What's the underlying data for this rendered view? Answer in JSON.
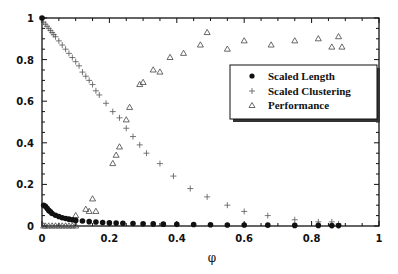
{
  "chart_data": {
    "type": "scatter",
    "title": "",
    "xlabel": "φ",
    "ylabel": "",
    "xlim": [
      0,
      1
    ],
    "ylim": [
      0,
      1
    ],
    "grid": false,
    "legend_position": "upper right (inside)",
    "x_ticks": [
      "0",
      "0.2",
      "0.4",
      "0.6",
      "0.8",
      "1"
    ],
    "y_ticks": [
      "0",
      "0.2",
      "0.4",
      "0.6",
      "0.8",
      "1"
    ],
    "series": [
      {
        "name": "Scaled Length",
        "marker": "filled-circle",
        "points": [
          [
            0.0,
            1.0
          ],
          [
            0.005,
            0.1
          ],
          [
            0.01,
            0.095
          ],
          [
            0.015,
            0.085
          ],
          [
            0.02,
            0.075
          ],
          [
            0.025,
            0.068
          ],
          [
            0.03,
            0.06
          ],
          [
            0.04,
            0.052
          ],
          [
            0.05,
            0.046
          ],
          [
            0.06,
            0.04
          ],
          [
            0.07,
            0.036
          ],
          [
            0.08,
            0.033
          ],
          [
            0.09,
            0.03
          ],
          [
            0.1,
            0.027
          ],
          [
            0.12,
            0.024
          ],
          [
            0.14,
            0.021
          ],
          [
            0.16,
            0.019
          ],
          [
            0.18,
            0.017
          ],
          [
            0.2,
            0.015
          ],
          [
            0.22,
            0.014
          ],
          [
            0.24,
            0.013
          ],
          [
            0.27,
            0.012
          ],
          [
            0.3,
            0.011
          ],
          [
            0.33,
            0.01
          ],
          [
            0.36,
            0.009
          ],
          [
            0.4,
            0.008
          ],
          [
            0.45,
            0.007
          ],
          [
            0.5,
            0.006
          ],
          [
            0.55,
            0.005
          ],
          [
            0.6,
            0.005
          ],
          [
            0.67,
            0.004
          ],
          [
            0.75,
            0.003
          ],
          [
            0.82,
            0.003
          ],
          [
            0.86,
            0.002
          ],
          [
            0.88,
            0.002
          ]
        ]
      },
      {
        "name": "Scaled Clustering",
        "marker": "plus",
        "points": [
          [
            0.005,
            0.98
          ],
          [
            0.01,
            0.97
          ],
          [
            0.015,
            0.96
          ],
          [
            0.02,
            0.95
          ],
          [
            0.025,
            0.94
          ],
          [
            0.03,
            0.93
          ],
          [
            0.035,
            0.92
          ],
          [
            0.04,
            0.91
          ],
          [
            0.05,
            0.89
          ],
          [
            0.06,
            0.87
          ],
          [
            0.07,
            0.85
          ],
          [
            0.08,
            0.83
          ],
          [
            0.09,
            0.81
          ],
          [
            0.1,
            0.79
          ],
          [
            0.11,
            0.77
          ],
          [
            0.12,
            0.74
          ],
          [
            0.13,
            0.72
          ],
          [
            0.14,
            0.7
          ],
          [
            0.15,
            0.68
          ],
          [
            0.16,
            0.65
          ],
          [
            0.17,
            0.63
          ],
          [
            0.19,
            0.59
          ],
          [
            0.21,
            0.55
          ],
          [
            0.23,
            0.52
          ],
          [
            0.25,
            0.47
          ],
          [
            0.27,
            0.43
          ],
          [
            0.29,
            0.39
          ],
          [
            0.31,
            0.35
          ],
          [
            0.35,
            0.3
          ],
          [
            0.39,
            0.24
          ],
          [
            0.44,
            0.18
          ],
          [
            0.49,
            0.14
          ],
          [
            0.55,
            0.1
          ],
          [
            0.6,
            0.07
          ],
          [
            0.67,
            0.05
          ],
          [
            0.75,
            0.03
          ],
          [
            0.82,
            0.02
          ],
          [
            0.86,
            0.02
          ],
          [
            0.88,
            0.01
          ]
        ]
      },
      {
        "name": "Performance",
        "marker": "open-triangle",
        "points": [
          [
            0.005,
            0.0
          ],
          [
            0.01,
            0.0
          ],
          [
            0.02,
            0.0
          ],
          [
            0.03,
            0.0
          ],
          [
            0.04,
            0.0
          ],
          [
            0.05,
            0.0
          ],
          [
            0.06,
            0.0
          ],
          [
            0.07,
            0.0
          ],
          [
            0.08,
            0.0
          ],
          [
            0.09,
            0.0
          ],
          [
            0.1,
            0.0
          ],
          [
            0.1,
            0.05
          ],
          [
            0.13,
            0.08
          ],
          [
            0.14,
            0.07
          ],
          [
            0.15,
            0.13
          ],
          [
            0.16,
            0.07
          ],
          [
            0.21,
            0.3
          ],
          [
            0.22,
            0.34
          ],
          [
            0.23,
            0.38
          ],
          [
            0.25,
            0.51
          ],
          [
            0.26,
            0.57
          ],
          [
            0.29,
            0.68
          ],
          [
            0.3,
            0.69
          ],
          [
            0.33,
            0.75
          ],
          [
            0.35,
            0.74
          ],
          [
            0.38,
            0.81
          ],
          [
            0.42,
            0.83
          ],
          [
            0.47,
            0.87
          ],
          [
            0.49,
            0.93
          ],
          [
            0.55,
            0.85
          ],
          [
            0.6,
            0.89
          ],
          [
            0.68,
            0.87
          ],
          [
            0.75,
            0.89
          ],
          [
            0.82,
            0.9
          ],
          [
            0.86,
            0.86
          ],
          [
            0.88,
            0.91
          ],
          [
            0.89,
            0.86
          ]
        ]
      }
    ]
  },
  "legend": {
    "items": [
      {
        "label": "Scaled Length",
        "symbol": "●"
      },
      {
        "label": "Scaled Clustering",
        "symbol": "+"
      },
      {
        "label": "Performance",
        "symbol": "△"
      }
    ]
  },
  "axes": {
    "xlabel": "φ",
    "x_ticks": [
      "0",
      "0.2",
      "0.4",
      "0.6",
      "0.8",
      "1"
    ],
    "y_ticks": [
      "0",
      "0.2",
      "0.4",
      "0.6",
      "0.8",
      "1"
    ]
  },
  "colors": {
    "ink": "#111111",
    "background": "#ffffff",
    "plus": "#555555",
    "triangle": "#444444"
  }
}
